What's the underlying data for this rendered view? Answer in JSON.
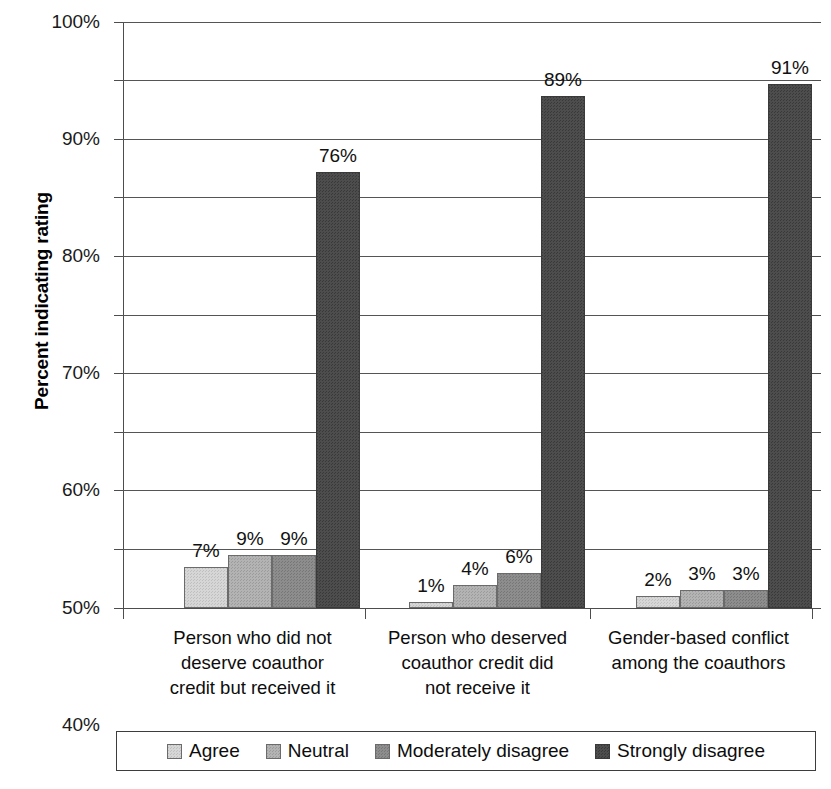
{
  "chart_data": {
    "type": "bar",
    "title": "",
    "xlabel": "",
    "ylabel": "Percent indicating rating",
    "ylim": [
      0,
      100
    ],
    "ytick_labels": [
      "0%",
      "10%",
      "20%",
      "30%",
      "40%",
      "50%",
      "60%",
      "70%",
      "80%",
      "90%",
      "100%"
    ],
    "ytick_values": [
      0,
      10,
      20,
      30,
      40,
      50,
      60,
      70,
      80,
      90,
      100
    ],
    "grid": true,
    "legend_position": "bottom",
    "categories": [
      "Person who did not deserve coauthor credit but received it",
      "Person who deserved coauthor credit did not receive it",
      "Gender-based conflict among the coauthors"
    ],
    "category_lines": [
      [
        "Person who did not",
        "deserve coauthor",
        "credit but received it"
      ],
      [
        "Person who deserved",
        "coauthor credit did",
        "not receive it"
      ],
      [
        "Gender-based conflict",
        "among the coauthors"
      ]
    ],
    "series": [
      {
        "name": "Agree",
        "color": "#d6d6d6",
        "values": [
          7,
          1,
          2
        ],
        "labels": [
          "7%",
          "1%",
          "2%"
        ]
      },
      {
        "name": "Neutral",
        "color": "#b3b3b3",
        "values": [
          9,
          4,
          3
        ],
        "labels": [
          "9%",
          "4%",
          "3%"
        ]
      },
      {
        "name": "Moderately disagree",
        "color": "#8d8d8d",
        "values": [
          9,
          6,
          3
        ],
        "labels": [
          "9%",
          "6%",
          "3%"
        ]
      },
      {
        "name": "Strongly disagree",
        "color": "#4d4d4d",
        "values": [
          76,
          89,
          91
        ],
        "labels": [
          "76%",
          "89%",
          "91%"
        ]
      }
    ]
  },
  "axis": {
    "y_title": "Percent indicating rating"
  },
  "legend": {
    "items": [
      {
        "label": "Agree"
      },
      {
        "label": "Neutral"
      },
      {
        "label": "Moderately disagree"
      },
      {
        "label": "Strongly disagree"
      }
    ]
  }
}
